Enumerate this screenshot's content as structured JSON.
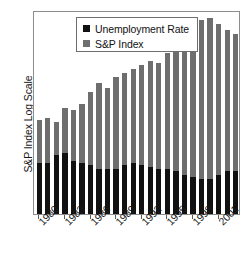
{
  "chart_data": {
    "type": "bar",
    "title": "",
    "subtitle": "",
    "xlabel": "",
    "ylabel": "S&P Index Log Scale",
    "grid": false,
    "legend_position": "top-center",
    "axis_note": "y axis is unlabeled log scale; x axis ticks every 3 years",
    "categories": [
      "1980",
      "1981",
      "1982",
      "1983",
      "1984",
      "1985",
      "1986",
      "1987",
      "1988",
      "1989",
      "1990",
      "1991",
      "1992",
      "1993",
      "1994",
      "1995",
      "1996",
      "1997",
      "1998",
      "1999",
      "2000",
      "2001",
      "2002",
      "2003"
    ],
    "tick_labels": [
      "1980",
      "1983",
      "1986",
      "1989",
      "1992",
      "1995",
      "1998",
      "2001"
    ],
    "series": [
      {
        "name": "S&P Index",
        "color": "#6e6e6e",
        "values": [
          46,
          47,
          45,
          52,
          51,
          54,
          60,
          64,
          62,
          67,
          69,
          71,
          73,
          75,
          74,
          79,
          83,
          86,
          91,
          95,
          96,
          93,
          90,
          88
        ]
      },
      {
        "name": "Unemployment Rate",
        "color": "#111111",
        "values": [
          25,
          25,
          29,
          30,
          26,
          25,
          24,
          22,
          22,
          22,
          24,
          25,
          24,
          23,
          22,
          22,
          21,
          19,
          18,
          17,
          17,
          19,
          21,
          21
        ]
      }
    ],
    "ylim": [
      0,
      100
    ]
  },
  "axes": {
    "y_title": "S&P Index Log Scale"
  },
  "legend": {
    "entries": [
      {
        "label": "Unemployment Rate",
        "swatch": "black-square-swatch"
      },
      {
        "label": "S&P Index",
        "swatch": "gray-square-swatch"
      }
    ]
  },
  "colors": {
    "sp_index": "#6e6e6e",
    "unemployment": "#111111",
    "frame": "#8d8d8d",
    "background": "#ffffff"
  }
}
